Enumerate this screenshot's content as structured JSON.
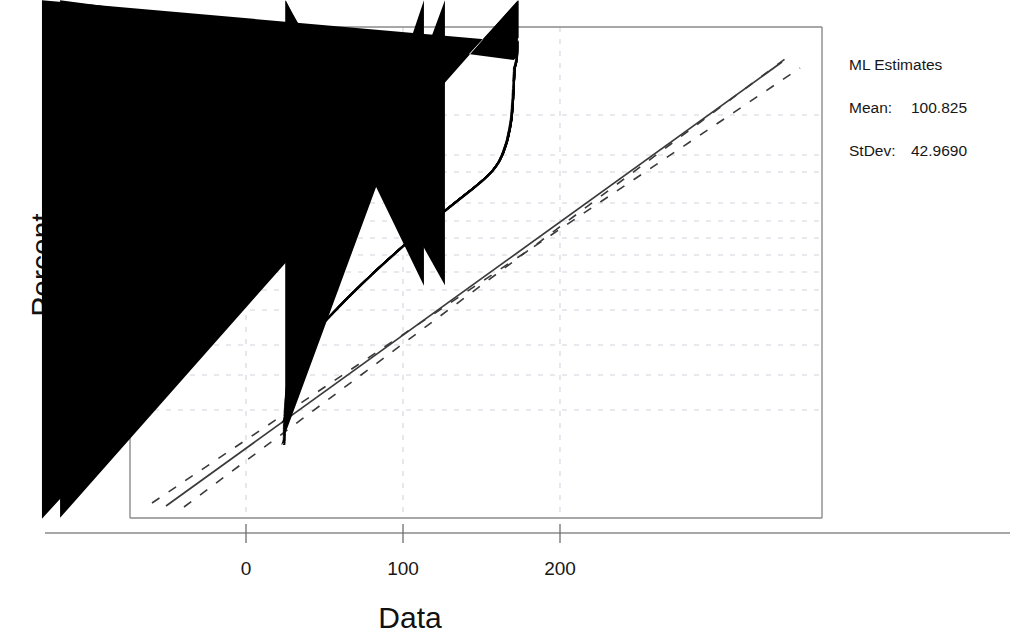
{
  "chart_data": {
    "type": "scatter",
    "plot_kind": "normal-probability-plot",
    "title": "",
    "xlabel": "Data",
    "ylabel": "Percent",
    "grid": true,
    "xlim": [
      -70,
      250
    ],
    "x_ticks": [
      0,
      100,
      200
    ],
    "x_tick_labels": [
      "0",
      "100",
      "200"
    ],
    "y_scale": "normal-probability",
    "y_ticks": [
      1,
      5,
      10,
      20,
      30,
      40,
      50,
      60,
      70,
      80,
      90,
      95,
      99
    ],
    "y_tick_labels": [
      "1",
      "5",
      "10",
      "20",
      "30",
      "40",
      "50",
      "60",
      "70",
      "80",
      "90",
      "95",
      "99"
    ],
    "ylim_percent": [
      0.05,
      99.95
    ],
    "series": [
      {
        "name": "data-points",
        "marker": "filled-diamond",
        "color": "#000000",
        "note": "Large sample of ordered observations plotted against normal scores; S-shaped (heavy/truncated tails) departure from the straight reference line.",
        "points": [
          [
            25.0,
            0.08
          ],
          [
            25.3,
            0.25
          ],
          [
            26.0,
            0.6
          ],
          [
            26.5,
            0.9
          ],
          [
            27.0,
            1.3
          ],
          [
            27.8,
            1.8
          ],
          [
            28.3,
            2.3
          ],
          [
            29.0,
            2.9
          ],
          [
            29.8,
            3.4
          ],
          [
            30.5,
            3.9
          ],
          [
            31.5,
            4.4
          ],
          [
            33.0,
            5.0
          ],
          [
            35.0,
            5.8
          ],
          [
            37.5,
            6.8
          ],
          [
            40.0,
            7.9
          ],
          [
            43.0,
            9.2
          ],
          [
            46.0,
            10.6
          ],
          [
            49.0,
            12.2
          ],
          [
            52.0,
            13.9
          ],
          [
            55.0,
            15.8
          ],
          [
            58.0,
            17.8
          ],
          [
            61.0,
            20.0
          ],
          [
            64.0,
            22.3
          ],
          [
            67.0,
            24.7
          ],
          [
            70.0,
            27.2
          ],
          [
            73.0,
            29.8
          ],
          [
            76.0,
            32.5
          ],
          [
            79.0,
            35.2
          ],
          [
            82.0,
            38.0
          ],
          [
            85.0,
            40.8
          ],
          [
            88.0,
            43.6
          ],
          [
            91.0,
            46.4
          ],
          [
            94.0,
            49.2
          ],
          [
            97.0,
            52.0
          ],
          [
            100.0,
            54.8
          ],
          [
            103.0,
            57.5
          ],
          [
            106.0,
            60.2
          ],
          [
            109.0,
            62.8
          ],
          [
            112.0,
            65.3
          ],
          [
            115.0,
            67.7
          ],
          [
            118.0,
            70.0
          ],
          [
            121.0,
            72.2
          ],
          [
            124.0,
            74.3
          ],
          [
            127.0,
            76.3
          ],
          [
            130.0,
            78.2
          ],
          [
            133.0,
            80.0
          ],
          [
            136.0,
            81.7
          ],
          [
            139.0,
            83.3
          ],
          [
            142.0,
            84.8
          ],
          [
            145.0,
            86.2
          ],
          [
            148.0,
            87.6
          ],
          [
            151.0,
            88.9
          ],
          [
            154.0,
            90.2
          ],
          [
            157.0,
            91.5
          ],
          [
            159.5,
            92.7
          ],
          [
            162.0,
            94.0
          ],
          [
            164.0,
            95.2
          ],
          [
            165.5,
            96.2
          ],
          [
            167.0,
            97.1
          ],
          [
            168.0,
            97.8
          ],
          [
            169.0,
            98.4
          ],
          [
            169.8,
            98.9
          ],
          [
            170.3,
            99.3
          ],
          [
            170.8,
            99.6
          ],
          [
            171.2,
            99.8
          ],
          [
            171.6,
            99.9
          ],
          [
            173.0,
            99.94
          ],
          [
            173.5,
            99.98
          ]
        ]
      },
      {
        "name": "fitted-normal-line",
        "style": "solid",
        "color": "#3a3a3a",
        "mean": 100.825,
        "stdev": 42.969
      },
      {
        "name": "confidence-band-upper",
        "style": "dashed",
        "color": "#3a3a3a"
      },
      {
        "name": "confidence-band-lower",
        "style": "dashed",
        "color": "#3a3a3a"
      }
    ]
  },
  "legend": {
    "title": "ML Estimates",
    "rows": [
      {
        "label": "Mean:",
        "value": "100.825"
      },
      {
        "label": "StDev:",
        "value": "42.9690"
      }
    ]
  },
  "axes": {
    "x_title": "Data",
    "y_title": "Percent",
    "x_tick_labels": [
      "0",
      "100",
      "200"
    ],
    "y_tick_labels": [
      "99",
      "95",
      "90",
      "80",
      "70",
      "60",
      "50",
      "40",
      "30",
      "20",
      "10",
      "5",
      "1"
    ]
  },
  "colors": {
    "background": "#ffffff",
    "frame": "#8a8a8a",
    "gridline": "#c9c9d6",
    "marker": "#000000",
    "line": "#3a3a3a",
    "text": "#171717"
  }
}
